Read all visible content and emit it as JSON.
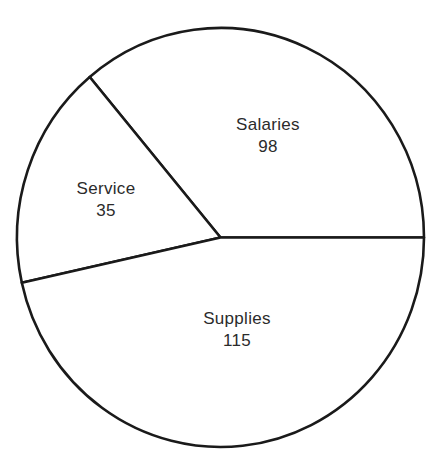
{
  "chart_data": {
    "type": "pie",
    "title": "",
    "subtitle": "",
    "xlabel": "",
    "ylabel": "",
    "legend": "none",
    "grid": false,
    "total": 248,
    "categories": [
      "Salaries",
      "Service",
      "Supplies"
    ],
    "values": [
      98,
      35,
      115
    ],
    "slices": [
      {
        "label": "Salaries",
        "value": "98",
        "value_number": 98,
        "percent": 39.5,
        "start_angle_deg": 0,
        "end_angle_deg": 130,
        "fill": "#ffffff",
        "stroke": "#1a1a1a",
        "label_x": 268,
        "label_y": 130,
        "value_x": 268,
        "value_y": 152
      },
      {
        "label": "Service",
        "value": "35",
        "value_number": 35,
        "percent": 14.1,
        "start_angle_deg": 130,
        "end_angle_deg": 192.5,
        "fill": "#ffffff",
        "stroke": "#1a1a1a",
        "label_x": 106,
        "label_y": 194,
        "value_x": 106,
        "value_y": 216
      },
      {
        "label": "Supplies",
        "value": "115",
        "value_number": 115,
        "percent": 46.4,
        "start_angle_deg": 192.5,
        "end_angle_deg": 360,
        "fill": "#ffffff",
        "stroke": "#1a1a1a",
        "label_x": 237,
        "label_y": 324,
        "value_x": 237,
        "value_y": 346
      }
    ],
    "geometry": {
      "center_x": 220.5,
      "center_y": 237.5,
      "radius_x": 203.5,
      "radius_y": 209.5,
      "stroke_width": 2.6
    },
    "colors": {
      "background": "#ffffff",
      "outline": "#1a1a1a",
      "text": "#2b2b2b"
    }
  }
}
